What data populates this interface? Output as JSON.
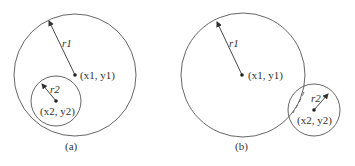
{
  "figure_a": {
    "caption": "(a)",
    "outer_circle": {
      "center_label": "(x1, y1)",
      "radius_label": "r1"
    },
    "inner_circle": {
      "center_label": "(x2, y2)",
      "radius_label": "r2"
    }
  },
  "figure_b": {
    "caption": "(b)",
    "outer_circle": {
      "center_label": "(x1, y1)",
      "radius_label": "r1"
    },
    "inner_circle": {
      "center_label": "(x2, y2)",
      "radius_label": "r2"
    }
  },
  "colors": {
    "stroke": "#555555",
    "text": "#333333"
  }
}
